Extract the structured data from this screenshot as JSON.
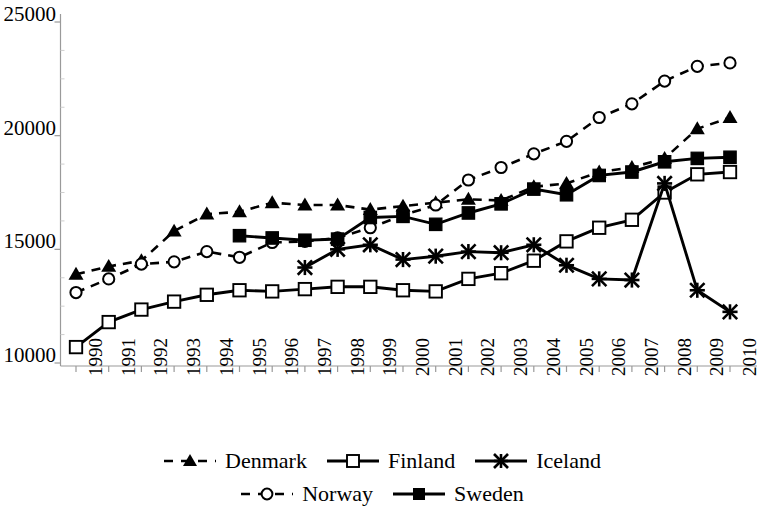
{
  "chart_data": {
    "type": "line",
    "title": "",
    "xlabel": "",
    "ylabel": "",
    "x": [
      1990,
      1991,
      1992,
      1993,
      1994,
      1995,
      1996,
      1997,
      1998,
      1999,
      2000,
      2001,
      2002,
      2003,
      2004,
      2005,
      2006,
      2007,
      2008,
      2009,
      2010
    ],
    "categories": [
      "1990",
      "1991",
      "1992",
      "1993",
      "1994",
      "1995",
      "1996",
      "1997",
      "1998",
      "1999",
      "2000",
      "2001",
      "2002",
      "2003",
      "2004",
      "2005",
      "2006",
      "2007",
      "2008",
      "2009",
      "2010"
    ],
    "ylim": [
      10000,
      25000
    ],
    "yticks": [
      10000,
      15000,
      20000,
      25000
    ],
    "ytick_labels": [
      "10000",
      "15000",
      "20000",
      "25000"
    ],
    "grid": false,
    "legend_position": "bottom",
    "series": [
      {
        "name": "Denmark",
        "marker": "filled-triangle",
        "line_style": "dashed",
        "color": "#000000",
        "x": [
          1990,
          1991,
          1992,
          1993,
          1994,
          1995,
          1996,
          1997,
          1998,
          1999,
          2000,
          2001,
          2002,
          2003,
          2004,
          2005,
          2006,
          2007,
          2008,
          2009,
          2010
        ],
        "values": [
          13900,
          14250,
          14500,
          15800,
          16550,
          16650,
          17050,
          16950,
          16950,
          16750,
          16900,
          17050,
          17200,
          17150,
          17750,
          17900,
          18400,
          18600,
          19000,
          20300,
          20800
        ]
      },
      {
        "name": "Finland",
        "marker": "open-square",
        "line_style": "solid",
        "color": "#000000",
        "x": [
          1990,
          1991,
          1992,
          1993,
          1994,
          1995,
          1996,
          1997,
          1998,
          1999,
          2000,
          2001,
          2002,
          2003,
          2004,
          2005,
          2006,
          2007,
          2008,
          2009,
          2010
        ],
        "values": [
          10700,
          11800,
          12350,
          12700,
          13000,
          13200,
          13150,
          13250,
          13350,
          13350,
          13200,
          13150,
          13700,
          13950,
          14500,
          15350,
          15950,
          16300,
          17500,
          18300,
          18400
        ]
      },
      {
        "name": "Iceland",
        "marker": "asterisk",
        "line_style": "solid",
        "color": "#000000",
        "x": [
          1997,
          1998,
          1999,
          2000,
          2001,
          2002,
          2003,
          2004,
          2005,
          2006,
          2007,
          2008,
          2009,
          2010
        ],
        "values": [
          14200,
          15000,
          15200,
          14550,
          14700,
          14900,
          14850,
          15200,
          14300,
          13700,
          13650,
          17900,
          13200,
          12250
        ]
      },
      {
        "name": "Norway",
        "marker": "open-circle",
        "line_style": "dashed",
        "color": "#000000",
        "x": [
          1990,
          1991,
          1992,
          1993,
          1994,
          1995,
          1996,
          1997,
          1998,
          1999,
          2000,
          2001,
          2002,
          2003,
          2004,
          2005,
          2006,
          2007,
          2008,
          2009,
          2010
        ],
        "values": [
          13100,
          13700,
          14350,
          14450,
          14900,
          14650,
          15300,
          15350,
          15500,
          15950,
          16500,
          16950,
          18050,
          18600,
          19200,
          19750,
          20800,
          21400,
          22400,
          23050,
          23200
        ]
      },
      {
        "name": "Sweden",
        "marker": "filled-square",
        "line_style": "solid",
        "color": "#000000",
        "x": [
          1995,
          1996,
          1997,
          1998,
          1999,
          2000,
          2001,
          2002,
          2003,
          2004,
          2005,
          2006,
          2007,
          2008,
          2009,
          2010
        ],
        "values": [
          15600,
          15500,
          15400,
          15450,
          16400,
          16450,
          16100,
          16600,
          17000,
          17650,
          17400,
          18250,
          18400,
          18850,
          19000,
          19050
        ]
      }
    ]
  },
  "legend": {
    "rows": [
      [
        {
          "label": "Denmark",
          "key": "dashed-filled-triangle"
        },
        {
          "label": "Finland",
          "key": "solid-open-square"
        },
        {
          "label": "Iceland",
          "key": "solid-asterisk"
        }
      ],
      [
        {
          "label": "Norway",
          "key": "dashed-open-circle"
        },
        {
          "label": "Sweden",
          "key": "solid-filled-square"
        }
      ]
    ]
  },
  "axis": {
    "y_labels": [
      "25000",
      "20000",
      "15000",
      "10000"
    ],
    "x_labels": [
      "1990",
      "1991",
      "1992",
      "1993",
      "1994",
      "1995",
      "1996",
      "1997",
      "1998",
      "1999",
      "2000",
      "2001",
      "2002",
      "2003",
      "2004",
      "2005",
      "2006",
      "2007",
      "2008",
      "2009",
      "2010"
    ]
  }
}
